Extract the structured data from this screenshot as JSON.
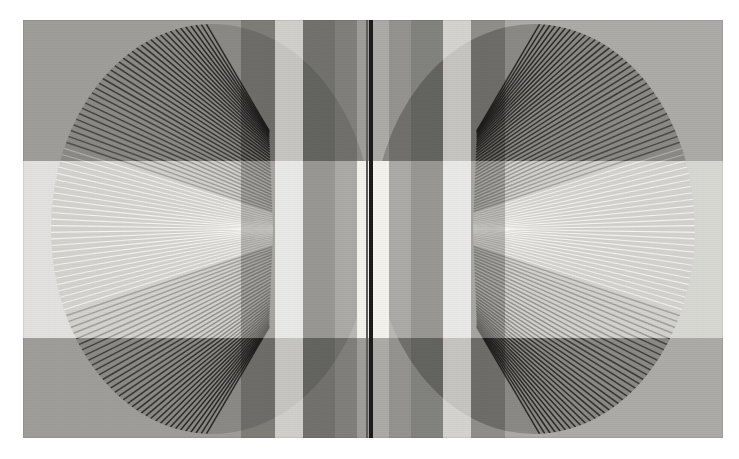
{
  "artwork": {
    "title": "Untitled (mirrored elliptical ray fans)",
    "medium": "abstract geometric op-art print",
    "canvas": {
      "image_width": 739,
      "image_height": 459,
      "plate_left": 23,
      "plate_top": 20,
      "plate_width": 700,
      "plate_height": 418,
      "paper_color": "#ffffff",
      "ground_color": "#d2d1cd"
    },
    "symmetry": {
      "axis": "vertical",
      "axis_x": 373,
      "description": "right half is a mirror image of the left half"
    },
    "divider": {
      "name": "center-dark-line",
      "x": 369,
      "width": 4,
      "color": "#1b1b1b",
      "hairline_color": "#5d5d5b",
      "hairline_x": 366,
      "hairline_width": 2
    },
    "disc": {
      "label": "elliptical disc",
      "center_x": 189,
      "center_y": 209,
      "radius_x": 161,
      "radius_y": 205,
      "fill": "#b7b6b2"
    },
    "ray_fan": {
      "label": "radiating line fan",
      "line_count": 96,
      "focus_x": 250,
      "focus_y": 209,
      "line_color_dark": "#2d2c2a",
      "line_color_light": "#f4f3ef",
      "angle_start_deg": -88,
      "angle_end_deg": 88,
      "description": "straight chords fanning from the ellipse rim toward two cusp foci, forming a caustic"
    },
    "bands": {
      "vertical": [
        {
          "name": "vband-1",
          "x": 218,
          "width": 34,
          "tone": "#9d9c98"
        },
        {
          "name": "vband-2",
          "x": 252,
          "width": 28,
          "tone": "#f0efe9"
        },
        {
          "name": "vband-3",
          "x": 280,
          "width": 32,
          "tone": "#7e7d7a"
        },
        {
          "name": "vband-4",
          "x": 312,
          "width": 22,
          "tone": "#a9a8a4"
        },
        {
          "name": "vband-5",
          "x": 334,
          "width": 32,
          "tone": "#f4f3ee"
        }
      ],
      "horizontal": [
        {
          "name": "hband-top",
          "y": 0,
          "height": 141,
          "tone": "#8f8e8b"
        },
        {
          "name": "hband-middle",
          "y": 141,
          "height": 177,
          "tone": "#e3e2dd"
        },
        {
          "name": "hband-bottom",
          "y": 318,
          "height": 100,
          "tone": "#8f8e8b"
        }
      ]
    },
    "palette": {
      "paper": "#ffffff",
      "ground": "#d2d1cd",
      "disc": "#b7b6b2",
      "dark": "#2d2c2a",
      "mid": "#8f8e8b",
      "light": "#f2f1ec",
      "line": "#1b1b1b"
    }
  }
}
